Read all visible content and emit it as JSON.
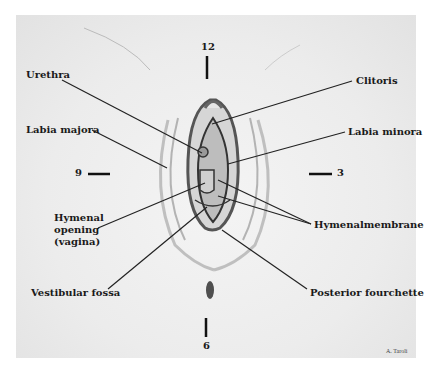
{
  "diagram": {
    "type": "anatomical-illustration",
    "clock_markers": {
      "twelve": "12",
      "three": "3",
      "six": "6",
      "nine": "9"
    },
    "labels": {
      "urethra": "Urethra",
      "clitoris": "Clitoris",
      "labia_majora": "Labia majora",
      "labia_minora": "Labia minora",
      "hymenal_opening_1": "Hymenal",
      "hymenal_opening_2": "opening",
      "hymenal_opening_3": "(vagina)",
      "hymenal_membrane": "Hymenalmembrane",
      "vestibular_fossa": "Vestibular fossa",
      "posterior_fourchette": "Posterior fourchette"
    },
    "credit": "A. Taroli",
    "colors": {
      "ink": "#1a1a1a",
      "background": "#ececec"
    }
  }
}
